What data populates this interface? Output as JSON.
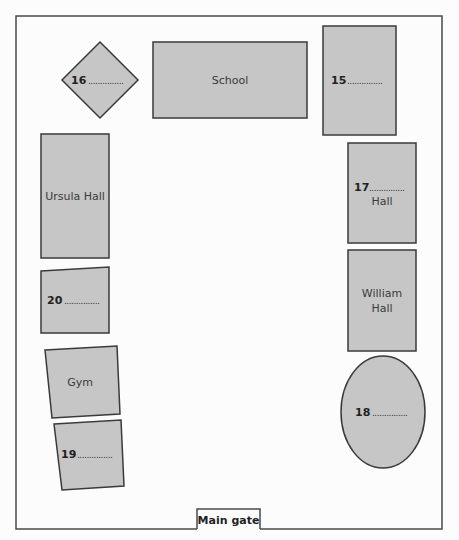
{
  "map": {
    "gate_label": "Main gate",
    "colors": {
      "building_fill": "#c6c6c6",
      "outline": "#3a3a3a",
      "background": "#fcfcfc"
    },
    "buildings": {
      "school": {
        "label": "School"
      },
      "ursula_hall": {
        "label": "Ursula Hall"
      },
      "william_hall": {
        "line1": "William",
        "line2": "Hall"
      },
      "gym": {
        "label": "Gym"
      },
      "q15": {
        "number": "15",
        "blank": "..............."
      },
      "q16": {
        "number": "16",
        "blank": "..............."
      },
      "q17": {
        "number": "17",
        "blank": "...............",
        "suffix": "Hall"
      },
      "q18": {
        "number": "18",
        "blank": "..............."
      },
      "q19": {
        "number": "19",
        "blank": "..............."
      },
      "q20": {
        "number": "20",
        "blank": "..............."
      }
    }
  }
}
